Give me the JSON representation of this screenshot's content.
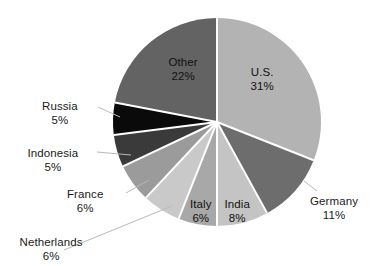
{
  "chart_data": {
    "type": "pie",
    "title": "",
    "subtitle": "",
    "xlabel": "",
    "ylabel": "",
    "legend_position": "none",
    "grid": false,
    "unit": "%",
    "total": 100,
    "categories": [
      "U.S.",
      "Germany",
      "India",
      "Italy",
      "Netherlands",
      "France",
      "Indonesia",
      "Russia",
      "Other"
    ],
    "values": [
      31,
      11,
      8,
      6,
      6,
      6,
      5,
      5,
      22
    ],
    "slices": [
      {
        "label": "U.S.",
        "value": 31,
        "value_text": "31%",
        "color": "#b3b3b3",
        "start_angle": 0,
        "end_angle": 111.6,
        "label_placement": "inside",
        "label_x": 262,
        "label_y": 66,
        "leader": false
      },
      {
        "label": "Germany",
        "value": 11,
        "value_text": "11%",
        "color": "#6d6d6d",
        "start_angle": 111.6,
        "end_angle": 151.2,
        "label_placement": "outside-right",
        "label_x": 334,
        "label_y": 195,
        "leader": true,
        "leader_from_x": 304,
        "leader_from_y": 181,
        "leader_to_x": 317,
        "leader_to_y": 191
      },
      {
        "label": "India",
        "value": 8,
        "value_text": "8%",
        "color": "#c4c4c4",
        "start_angle": 151.2,
        "end_angle": 180.0,
        "label_placement": "inside",
        "label_x": 237,
        "label_y": 198,
        "leader": false
      },
      {
        "label": "Italy",
        "value": 6,
        "value_text": "6%",
        "color": "#a8a8a8",
        "start_angle": 180.0,
        "end_angle": 201.6,
        "label_placement": "inside",
        "label_x": 201,
        "label_y": 198,
        "leader": false
      },
      {
        "label": "Netherlands",
        "value": 6,
        "value_text": "6%",
        "color": "#c9c9c9",
        "start_angle": 201.6,
        "end_angle": 223.2,
        "label_placement": "outside-left",
        "label_x": 51,
        "label_y": 236,
        "leader": true,
        "leader_from_x": 172,
        "leader_from_y": 206,
        "leader_to_x": 64,
        "leader_to_y": 250
      },
      {
        "label": "France",
        "value": 6,
        "value_text": "6%",
        "color": "#9b9b9b",
        "start_angle": 223.2,
        "end_angle": 244.8,
        "label_placement": "outside-left",
        "label_x": 85,
        "label_y": 188,
        "leader": true,
        "leader_from_x": 149,
        "leader_from_y": 180,
        "leader_to_x": 126,
        "leader_to_y": 193
      },
      {
        "label": "Indonesia",
        "value": 5,
        "value_text": "5%",
        "color": "#3a3a3a",
        "start_angle": 244.8,
        "end_angle": 262.8,
        "label_placement": "outside-left",
        "label_x": 53,
        "label_y": 147,
        "leader": true,
        "leader_from_x": 131,
        "leader_from_y": 155,
        "leader_to_x": 97,
        "leader_to_y": 152
      },
      {
        "label": "Russia",
        "value": 5,
        "value_text": "5%",
        "color": "#0a0a0a",
        "start_angle": 262.8,
        "end_angle": 280.8,
        "label_placement": "outside-left",
        "label_x": 60,
        "label_y": 100,
        "leader": true,
        "leader_from_x": 120,
        "leader_from_y": 117,
        "leader_to_x": 98,
        "leader_to_y": 107
      },
      {
        "label": "Other",
        "value": 22,
        "value_text": "22%",
        "color": "#636363",
        "start_angle": 280.8,
        "end_angle": 360.0,
        "label_placement": "inside",
        "label_x": 183,
        "label_y": 56,
        "leader": false
      }
    ],
    "geometry": {
      "center_x": 217,
      "center_y": 122,
      "radius": 104,
      "separator_color": "#ffffff",
      "separator_width": 2,
      "background": "#ffffff",
      "leader_color": "#b9b9b9"
    }
  }
}
